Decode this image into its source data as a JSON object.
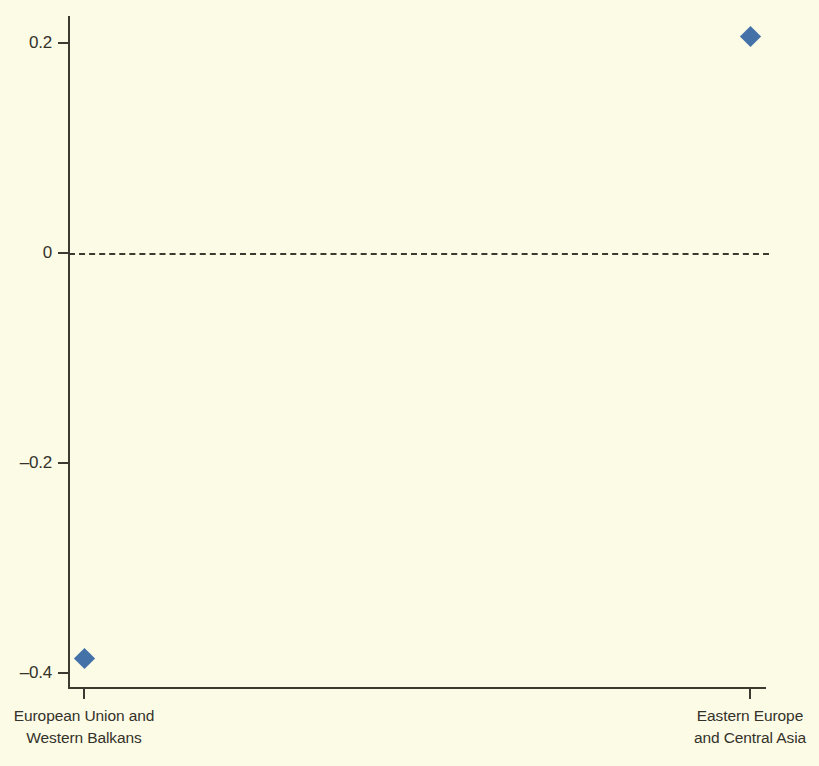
{
  "chart_data": {
    "type": "scatter",
    "title": "",
    "subtitle": "",
    "xlabel": "",
    "ylabel": "",
    "categories": [
      "European Union and\nWestern Balkans",
      "Eastern Europe\nand Central Asia"
    ],
    "values": [
      -0.386,
      0.206
    ],
    "series": [
      {
        "name": "",
        "marker": "diamond",
        "color": "#4472A8",
        "points": [
          {
            "category": "European Union and\nWestern Balkans",
            "x": 0,
            "y": -0.386
          },
          {
            "category": "Eastern Europe\nand Central Asia",
            "x": 1,
            "y": 0.206
          }
        ]
      }
    ],
    "ylim": [
      -0.4133,
      0.2257
    ],
    "yticks": [
      0.2,
      0,
      -0.2,
      -0.4
    ],
    "ytick_labels": [
      "0.2",
      "0",
      "–0.2",
      "–0.4"
    ],
    "xticks": [
      0,
      1
    ],
    "xtick_labels": [
      "European Union and\nWestern Balkans",
      "Eastern Europe\nand Central Asia"
    ],
    "grid": false,
    "legend": false,
    "legend_position": "none",
    "annotations": [
      {
        "name": "zero-reference-line",
        "type": "hline",
        "y": 0,
        "style": "dashed",
        "color": "#3B3A30"
      }
    ],
    "colors": {
      "background": "#FCFBE6",
      "axis": "#3B3A30",
      "marker": "#4472A8",
      "text": "#34322A"
    }
  }
}
